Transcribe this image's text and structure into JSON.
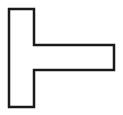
{
  "canvas": {
    "width": 123,
    "height": 115,
    "background_color": "#ffffff",
    "title": "tack-shape-figure"
  },
  "figure": {
    "name": "left-tack-shape",
    "glyph": "⊢",
    "fill_color": "#ffffff",
    "stroke_color": "#1a1a1a",
    "stroke_width": 2.5,
    "stroke_linejoin": "miter",
    "points": "9,9 34,9 34,45 114,45 114,70 34,70 34,107 9,107",
    "vertices": [
      {
        "label": "top-left",
        "x": 9,
        "y": 9
      },
      {
        "label": "top-right-of-stem",
        "x": 34,
        "y": 9
      },
      {
        "label": "arm-inner-top",
        "x": 34,
        "y": 45
      },
      {
        "label": "arm-outer-top",
        "x": 114,
        "y": 45
      },
      {
        "label": "arm-outer-bottom",
        "x": 114,
        "y": 70
      },
      {
        "label": "arm-inner-bottom",
        "x": 34,
        "y": 70
      },
      {
        "label": "bottom-right-of-stem",
        "x": 34,
        "y": 107
      },
      {
        "label": "bottom-left",
        "x": 9,
        "y": 107
      }
    ],
    "parts": {
      "vertical_bar": {
        "x": 9,
        "y": 9,
        "width": 25,
        "height": 98
      },
      "horizontal_arm": {
        "x": 34,
        "y": 45,
        "width": 80,
        "height": 25
      }
    }
  }
}
